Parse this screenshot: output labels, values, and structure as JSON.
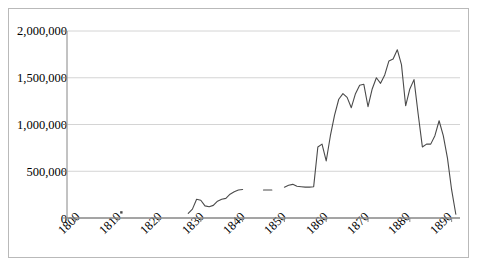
{
  "chart_data": {
    "type": "line",
    "title": "",
    "subtitle": "",
    "xlabel": "",
    "ylabel": "",
    "xlim": [
      1798,
      1892
    ],
    "ylim": [
      0,
      2000000
    ],
    "grid": true,
    "legend": false,
    "legend_position": "none",
    "y_ticks": [
      0,
      500000,
      1000000,
      1500000,
      2000000
    ],
    "y_ticklabels": [
      "0",
      "500,000",
      "1,000,000",
      "1,500,000",
      "2,000,000"
    ],
    "x_ticks": [
      1800,
      1810,
      1820,
      1830,
      1840,
      1850,
      1860,
      1870,
      1880,
      1890
    ],
    "x_ticklabels": [
      "1800",
      "1810",
      "1820",
      "1830",
      "1840",
      "1850",
      "1860",
      "1870",
      "1880",
      "1890"
    ],
    "line_color": "#4a4a4a",
    "grid_color": "#d4d4d4",
    "axis_color": "#868686",
    "series": [
      {
        "name": "series-1",
        "x": [
          1811,
          1827,
          1828,
          1829,
          1830,
          1831,
          1832,
          1833,
          1834,
          1835,
          1836,
          1837,
          1838,
          1839,
          1840,
          1845,
          1846,
          1847,
          1850,
          1851,
          1852,
          1853,
          1854,
          1855,
          1856,
          1857,
          1858,
          1859,
          1860,
          1861,
          1862,
          1863,
          1864,
          1865,
          1866,
          1867,
          1868,
          1869,
          1870,
          1871,
          1872,
          1873,
          1874,
          1875,
          1876,
          1877,
          1878,
          1879,
          1880,
          1881,
          1882,
          1883,
          1884,
          1885,
          1886,
          1887,
          1888,
          1889,
          1890,
          1891
        ],
        "y": [
          60000,
          50000,
          95000,
          200000,
          190000,
          130000,
          120000,
          135000,
          180000,
          200000,
          210000,
          255000,
          280000,
          300000,
          305000,
          300000,
          300000,
          300000,
          330000,
          350000,
          360000,
          340000,
          335000,
          330000,
          330000,
          335000,
          760000,
          790000,
          610000,
          880000,
          1100000,
          1270000,
          1330000,
          1290000,
          1180000,
          1330000,
          1420000,
          1430000,
          1190000,
          1380000,
          1500000,
          1440000,
          1530000,
          1680000,
          1700000,
          1800000,
          1640000,
          1200000,
          1380000,
          1480000,
          1110000,
          760000,
          790000,
          790000,
          880000,
          1040000,
          880000,
          640000,
          300000,
          40000
        ],
        "segments": [
          {
            "from_index": 0,
            "to_index": 0,
            "style": "point"
          },
          {
            "from_index": 1,
            "to_index": 14,
            "style": "line"
          },
          {
            "from_index": 15,
            "to_index": 17,
            "style": "line"
          },
          {
            "from_index": 18,
            "to_index": 59,
            "style": "line"
          }
        ],
        "notes": "Gaps in data between 1840-1845 and 1847-1850; isolated single observation at 1811."
      }
    ]
  },
  "axis": {
    "y_label_0": "0",
    "y_label_1": "500,000",
    "y_label_2": "1,000,000",
    "y_label_3": "1,500,000",
    "y_label_4": "2,000,000",
    "x_label_0": "1800",
    "x_label_1": "1810",
    "x_label_2": "1820",
    "x_label_3": "1830",
    "x_label_4": "1840",
    "x_label_5": "1850",
    "x_label_6": "1860",
    "x_label_7": "1870",
    "x_label_8": "1880",
    "x_label_9": "1890"
  }
}
